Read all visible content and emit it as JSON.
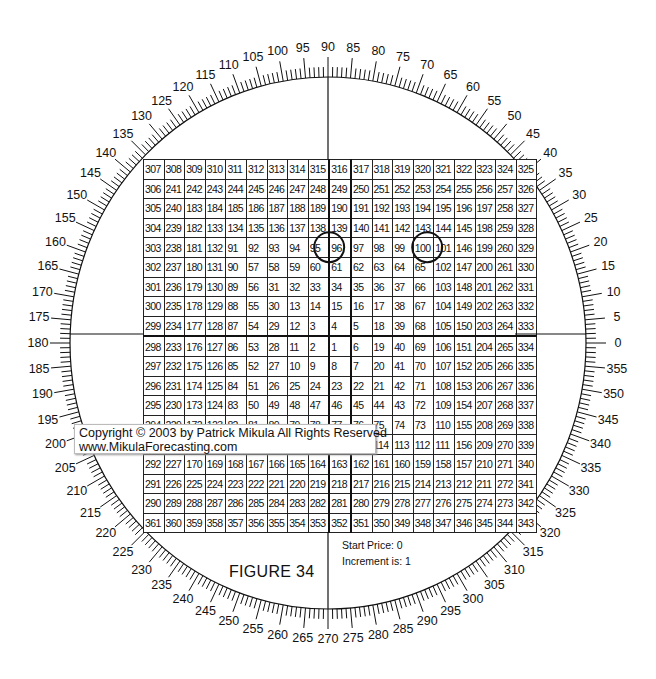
{
  "figure": {
    "label": "FIGURE  34",
    "start_price": "Start Price: 0",
    "increment": "Increment is: 1"
  },
  "copyright": {
    "line1": "Copyright © 2003 by Patrick Mikula All Rights Reserved",
    "line2": "www.MikulaForecasting.com"
  },
  "wheel": {
    "degree_labels_step": 5,
    "degree_labels": [
      0,
      5,
      10,
      15,
      20,
      25,
      30,
      35,
      40,
      45,
      50,
      55,
      60,
      65,
      70,
      75,
      80,
      85,
      90,
      95,
      100,
      105,
      110,
      115,
      120,
      125,
      130,
      135,
      140,
      145,
      150,
      155,
      160,
      165,
      170,
      175,
      180,
      185,
      190,
      195,
      200,
      205,
      210,
      215,
      220,
      225,
      230,
      235,
      240,
      245,
      250,
      255,
      260,
      265,
      270,
      275,
      280,
      285,
      290,
      295,
      300,
      305,
      310,
      315,
      320,
      325,
      330,
      335,
      340,
      345,
      350,
      355
    ],
    "center": [
      328,
      343
    ],
    "radius": [
      258,
      266
    ]
  },
  "highlighted_cells": [
    "96",
    "101"
  ],
  "grid": [
    [
      "307",
      "308",
      "309",
      "310",
      "311",
      "312",
      "313",
      "314",
      "315",
      "316",
      "317",
      "318",
      "319",
      "320",
      "321",
      "322",
      "323",
      "324",
      "325"
    ],
    [
      "306",
      "241",
      "242",
      "243",
      "244",
      "245",
      "246",
      "247",
      "248",
      "249",
      "250",
      "251",
      "252",
      "253",
      "254",
      "255",
      "256",
      "257",
      "326"
    ],
    [
      "305",
      "240",
      "183",
      "184",
      "185",
      "186",
      "187",
      "188",
      "189",
      "190",
      "191",
      "192",
      "193",
      "194",
      "195",
      "196",
      "197",
      "258",
      "327"
    ],
    [
      "304",
      "239",
      "182",
      "133",
      "134",
      "135",
      "136",
      "137",
      "138",
      "139",
      "140",
      "141",
      "142",
      "143",
      "144",
      "145",
      "198",
      "259",
      "328"
    ],
    [
      "303",
      "238",
      "181",
      "132",
      "91",
      "92",
      "93",
      "94",
      "95",
      "96",
      "97",
      "98",
      "99",
      "100",
      "101",
      "146",
      "199",
      "260",
      "329"
    ],
    [
      "302",
      "237",
      "180",
      "131",
      "90",
      "57",
      "58",
      "59",
      "60",
      "61",
      "62",
      "63",
      "64",
      "65",
      "102",
      "147",
      "200",
      "261",
      "330"
    ],
    [
      "301",
      "236",
      "179",
      "130",
      "89",
      "56",
      "31",
      "32",
      "33",
      "34",
      "35",
      "36",
      "37",
      "66",
      "103",
      "148",
      "201",
      "262",
      "331"
    ],
    [
      "300",
      "235",
      "178",
      "129",
      "88",
      "55",
      "30",
      "13",
      "14",
      "15",
      "16",
      "17",
      "38",
      "67",
      "104",
      "149",
      "202",
      "263",
      "332"
    ],
    [
      "299",
      "234",
      "177",
      "128",
      "87",
      "54",
      "29",
      "12",
      "3",
      "4",
      "5",
      "18",
      "39",
      "68",
      "105",
      "150",
      "203",
      "264",
      "333"
    ],
    [
      "298",
      "233",
      "176",
      "127",
      "86",
      "53",
      "28",
      "11",
      "2",
      "1",
      "6",
      "19",
      "40",
      "69",
      "106",
      "151",
      "204",
      "265",
      "334"
    ],
    [
      "297",
      "232",
      "175",
      "126",
      "85",
      "52",
      "27",
      "10",
      "9",
      "8",
      "7",
      "20",
      "41",
      "70",
      "107",
      "152",
      "205",
      "266",
      "335"
    ],
    [
      "296",
      "231",
      "174",
      "125",
      "84",
      "51",
      "26",
      "25",
      "24",
      "23",
      "22",
      "21",
      "42",
      "71",
      "108",
      "153",
      "206",
      "267",
      "336"
    ],
    [
      "295",
      "230",
      "173",
      "124",
      "83",
      "50",
      "49",
      "48",
      "47",
      "46",
      "45",
      "44",
      "43",
      "72",
      "109",
      "154",
      "207",
      "268",
      "337"
    ],
    [
      "294",
      "229",
      "172",
      "123",
      "82",
      "81",
      "80",
      "79",
      "78",
      "77",
      "76",
      "75",
      "74",
      "73",
      "110",
      "155",
      "208",
      "269",
      "338"
    ],
    [
      "293",
      "228",
      "171",
      "122",
      "121",
      "120",
      "119",
      "118",
      "117",
      "116",
      "115",
      "114",
      "113",
      "112",
      "111",
      "156",
      "209",
      "270",
      "339"
    ],
    [
      "292",
      "227",
      "170",
      "169",
      "168",
      "167",
      "166",
      "165",
      "164",
      "163",
      "162",
      "161",
      "160",
      "159",
      "158",
      "157",
      "210",
      "271",
      "340"
    ],
    [
      "291",
      "226",
      "225",
      "224",
      "223",
      "222",
      "221",
      "220",
      "219",
      "218",
      "217",
      "216",
      "215",
      "214",
      "213",
      "212",
      "211",
      "272",
      "341"
    ],
    [
      "290",
      "289",
      "288",
      "287",
      "286",
      "285",
      "284",
      "283",
      "282",
      "281",
      "280",
      "279",
      "278",
      "277",
      "276",
      "275",
      "274",
      "273",
      "342"
    ],
    [
      "361",
      "360",
      "359",
      "358",
      "357",
      "356",
      "355",
      "354",
      "353",
      "352",
      "351",
      "350",
      "349",
      "348",
      "347",
      "346",
      "345",
      "344",
      "343"
    ]
  ]
}
